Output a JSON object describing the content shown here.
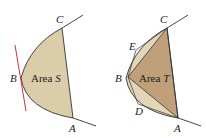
{
  "left_figure": {
    "area_label": "Area ",
    "area_var": "S",
    "points": {
      "A": "A",
      "B": "B",
      "C": "C"
    },
    "colors": {
      "fill": "#dccdaa",
      "tangent": "#d8303a",
      "curve": "#333333"
    }
  },
  "right_figure": {
    "area_label": "Area ",
    "area_var": "T",
    "points": {
      "A": "A",
      "B": "B",
      "C": "C",
      "D": "D",
      "E": "E"
    },
    "colors": {
      "fill_light": "#e3d6b8",
      "fill_dark": "#bfa07a",
      "curve": "#333333"
    }
  }
}
